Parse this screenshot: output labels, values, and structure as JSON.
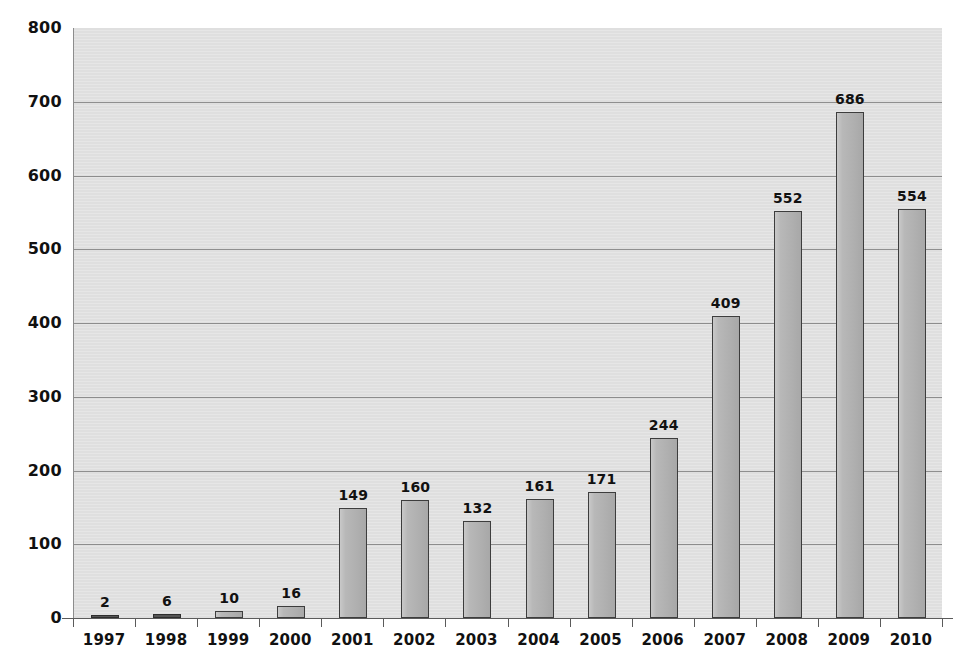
{
  "chart_data": {
    "type": "bar",
    "title": "",
    "subtitle": "",
    "xlabel": "",
    "ylabel": "",
    "categories": [
      "1997",
      "1998",
      "1999",
      "2000",
      "2001",
      "2002",
      "2003",
      "2004",
      "2005",
      "2006",
      "2007",
      "2008",
      "2009",
      "2010"
    ],
    "values": [
      2,
      6,
      10,
      16,
      149,
      160,
      132,
      161,
      171,
      244,
      409,
      552,
      686,
      554
    ],
    "data_labels": [
      "2",
      "6",
      "10",
      "16",
      "149",
      "160",
      "132",
      "161",
      "171",
      "244",
      "409",
      "552",
      "686",
      "554"
    ],
    "ylim": [
      0,
      800
    ],
    "ytick_values": [
      0,
      100,
      200,
      300,
      400,
      500,
      600,
      700,
      800
    ],
    "ytick_labels": [
      "0",
      "100",
      "200",
      "300",
      "400",
      "500",
      "600",
      "700",
      "800"
    ],
    "ytick_interval": 100,
    "grid": true,
    "grid_axis": "y",
    "legend": false,
    "legend_position": "none",
    "show_data_labels": true,
    "series": [
      {
        "name": "",
        "values": [
          2,
          6,
          10,
          16,
          149,
          160,
          132,
          161,
          171,
          244,
          409,
          552,
          686,
          554
        ]
      }
    ],
    "colors": {
      "bar_fill": "#b4b4b4",
      "bar_border": "#3d3d3d",
      "plot_background": "#e2e2e2",
      "gridline": "#6e6e6e",
      "axis": "#5b5b5b",
      "text": "#111111",
      "page_background": "#ffffff"
    }
  }
}
